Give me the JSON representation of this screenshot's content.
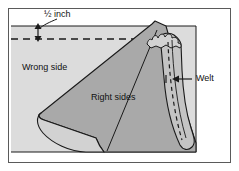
{
  "figure": {
    "frame": {
      "border_color": "#5a5a5a",
      "background_color": "#ffffff"
    },
    "colors": {
      "fabric_light": "#dcdcdc",
      "fabric_mid": "#d2d2d2",
      "fabric_dark": "#a9a9a9",
      "welt_fill": "#c4c4c4",
      "outline": "#1a1a1a",
      "text": "#111111",
      "dashed_line": "#1a1a1a"
    },
    "labels": {
      "dimension": "½ inch",
      "wrong_side": "Wrong side",
      "right_sides": "Right sides",
      "welt": "Welt"
    },
    "annotations": {
      "dimension_value": "½",
      "dimension_unit": "inch",
      "dimension_arrow": "double-headed-vertical-arrow",
      "welt_arrow": "left-pointing-arrow",
      "guideline_style": "dashed",
      "stitch_line_style": "dashed"
    },
    "parts": [
      {
        "name": "main-fabric-panel",
        "label": "Wrong side"
      },
      {
        "name": "folded-flap",
        "label": "Right sides"
      },
      {
        "name": "welt-strip",
        "label": "Welt"
      }
    ]
  }
}
